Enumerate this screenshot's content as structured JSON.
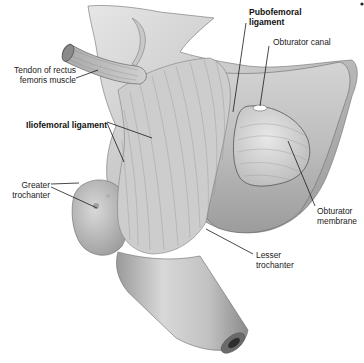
{
  "figure": {
    "colors": {
      "background": "#ffffff",
      "bone_light": "#dcdcdc",
      "bone_mid": "#b4b4b4",
      "bone_dark": "#7a7a7a",
      "leader_line": "#1a1a1a"
    },
    "marker_dot": "•"
  },
  "labels": [
    {
      "id": "pubofemoral",
      "text": "Pubofemoral\nligament",
      "bold": true,
      "x": 249,
      "y": 7,
      "align": "left"
    },
    {
      "id": "obturator-canal",
      "text": "Obturator canal",
      "bold": false,
      "x": 273,
      "y": 37,
      "align": "left"
    },
    {
      "id": "tendon-rectus",
      "text": "Tendon of rectus\nfemoris muscle",
      "bold": false,
      "x": 4,
      "y": 65,
      "align": "right"
    },
    {
      "id": "iliofemoral",
      "text": "Iliofemoral ligament",
      "bold": true,
      "x": 26,
      "y": 120,
      "align": "left"
    },
    {
      "id": "greater-trochanter",
      "text": "Greater\ntrochanter",
      "bold": false,
      "x": 6,
      "y": 180,
      "align": "right"
    },
    {
      "id": "obturator-membrane",
      "text": "Obturator\nmembrane",
      "bold": false,
      "x": 317,
      "y": 206,
      "align": "left"
    },
    {
      "id": "lesser-trochanter",
      "text": "Lesser\ntrochanter",
      "bold": false,
      "x": 256,
      "y": 250,
      "align": "left"
    }
  ],
  "leaders": [
    {
      "id": "pubofemoral",
      "points": [
        [
          246,
          23
        ],
        [
          233,
          112
        ]
      ]
    },
    {
      "id": "obturator-canal",
      "points": [
        [
          269,
          46
        ],
        [
          260,
          106
        ]
      ]
    },
    {
      "id": "tendon-rectus",
      "points": [
        [
          76,
          78
        ],
        [
          98,
          70
        ]
      ]
    },
    {
      "id": "iliofemoral-a",
      "points": [
        [
          107,
          122
        ],
        [
          152,
          138
        ]
      ]
    },
    {
      "id": "iliofemoral-b",
      "points": [
        [
          107,
          123
        ],
        [
          124,
          162
        ]
      ]
    },
    {
      "id": "greater-trochanter-a",
      "points": [
        [
          51,
          184
        ],
        [
          79,
          183
        ]
      ]
    },
    {
      "id": "greater-trochanter-b",
      "points": [
        [
          51,
          187
        ],
        [
          97,
          208
        ]
      ]
    },
    {
      "id": "obturator-membrane",
      "points": [
        [
          315,
          206
        ],
        [
          288,
          141
        ]
      ]
    },
    {
      "id": "lesser-trochanter",
      "points": [
        [
          253,
          254
        ],
        [
          206,
          229
        ]
      ]
    }
  ]
}
